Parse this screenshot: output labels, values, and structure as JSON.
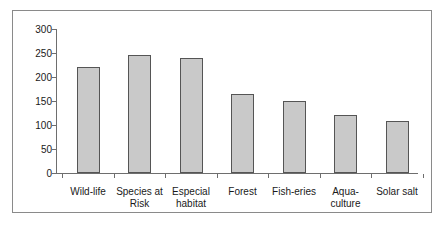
{
  "chart_data": {
    "type": "bar",
    "title": "",
    "xlabel": "",
    "ylabel": "",
    "ylim": [
      0,
      300
    ],
    "y_ticks": [
      0,
      50,
      100,
      150,
      200,
      250,
      300
    ],
    "y_tick_labels": [
      "0",
      "50",
      "100",
      "150",
      "200",
      "250",
      "300"
    ],
    "grid": false,
    "legend": "none",
    "bar_fill_color": "#c9c9c9",
    "bar_edge_color": "#555555",
    "axis_color": "#6e6e6e",
    "border_color": "#8a8a8a",
    "categories": [
      "Wild-life",
      "Species at\nRisk",
      "Especial\nhabitat",
      "Forest",
      "Fish-eries",
      "Aqua-\nculture",
      "Solar salt"
    ],
    "values": [
      220,
      245,
      240,
      165,
      150,
      120,
      108
    ]
  }
}
